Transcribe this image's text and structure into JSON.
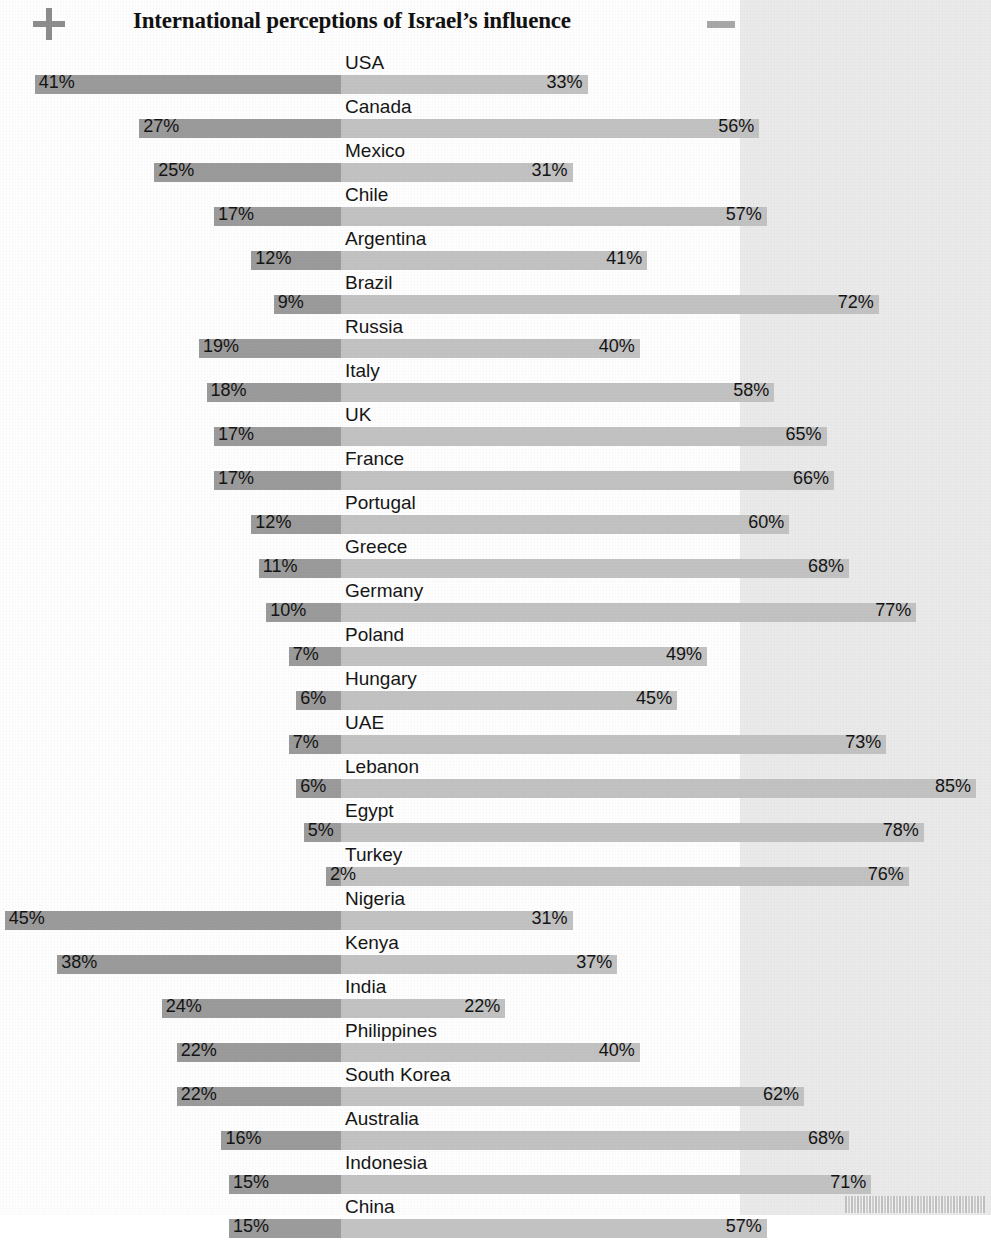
{
  "header": {
    "title": "International perceptions of Israel’s influence",
    "plus_icon": "plus-icon",
    "minus_icon": "minus-icon"
  },
  "footer": {
    "barcode": "barcode-stub"
  },
  "colors": {
    "bar_left": "#9b9b9b",
    "bar_right": "#c2c2c2",
    "tint_band": "#eaeaea",
    "text": "#141414",
    "icon": "#8d8d8d"
  },
  "chart_data": {
    "type": "bar",
    "subtype": "diverging-horizontal",
    "title": "International perceptions of Israel’s influence",
    "xlabel": "",
    "ylabel": "",
    "grid": false,
    "legend_position": "none",
    "axis_center_percent": 0,
    "units": "%",
    "series": [
      {
        "name": "Mainly positive",
        "direction": "left",
        "color": "#9b9b9b"
      },
      {
        "name": "Mainly negative",
        "direction": "right",
        "color": "#c2c2c2"
      }
    ],
    "categories": [
      "USA",
      "Canada",
      "Mexico",
      "Chile",
      "Argentina",
      "Brazil",
      "Russia",
      "Italy",
      "UK",
      "France",
      "Portugal",
      "Greece",
      "Germany",
      "Poland",
      "Hungary",
      "UAE",
      "Lebanon",
      "Egypt",
      "Turkey",
      "Nigeria",
      "Kenya",
      "India",
      "Philippines",
      "South Korea",
      "Australia",
      "Indonesia",
      "China"
    ],
    "left_values": [
      41,
      27,
      25,
      17,
      12,
      9,
      19,
      18,
      17,
      17,
      12,
      11,
      10,
      7,
      6,
      7,
      6,
      5,
      2,
      45,
      38,
      24,
      22,
      22,
      16,
      15,
      15
    ],
    "right_values": [
      33,
      56,
      31,
      57,
      41,
      72,
      40,
      58,
      65,
      66,
      60,
      68,
      77,
      49,
      45,
      73,
      85,
      78,
      76,
      31,
      37,
      22,
      40,
      62,
      68,
      71,
      57
    ],
    "left_labels": [
      "41%",
      "27%",
      "25%",
      "17%",
      "12%",
      "9%",
      "19%",
      "18%",
      "17%",
      "17%",
      "12%",
      "11%",
      "10%",
      "7%",
      "6%",
      "7%",
      "6%",
      "5%",
      "2%",
      "45%",
      "38%",
      "24%",
      "22%",
      "22%",
      "16%",
      "15%",
      "15%"
    ],
    "right_labels": [
      "33%",
      "56%",
      "31%",
      "57%",
      "41%",
      "72%",
      "40%",
      "58%",
      "65%",
      "66%",
      "60%",
      "68%",
      "77%",
      "49%",
      "45%",
      "73%",
      "85%",
      "78%",
      "76%",
      "31%",
      "37%",
      "22%",
      "40%",
      "62%",
      "68%",
      "71%",
      "57%"
    ],
    "xlim": [
      -50,
      90
    ]
  },
  "rows": [
    {
      "country": "USA",
      "left": 41,
      "right": 33,
      "left_label": "41%",
      "right_label": "33%"
    },
    {
      "country": "Canada",
      "left": 27,
      "right": 56,
      "left_label": "27%",
      "right_label": "56%"
    },
    {
      "country": "Mexico",
      "left": 25,
      "right": 31,
      "left_label": "25%",
      "right_label": "31%"
    },
    {
      "country": "Chile",
      "left": 17,
      "right": 57,
      "left_label": "17%",
      "right_label": "57%"
    },
    {
      "country": "Argentina",
      "left": 12,
      "right": 41,
      "left_label": "12%",
      "right_label": "41%"
    },
    {
      "country": "Brazil",
      "left": 9,
      "right": 72,
      "left_label": "9%",
      "right_label": "72%"
    },
    {
      "country": "Russia",
      "left": 19,
      "right": 40,
      "left_label": "19%",
      "right_label": "40%"
    },
    {
      "country": "Italy",
      "left": 18,
      "right": 58,
      "left_label": "18%",
      "right_label": "58%"
    },
    {
      "country": "UK",
      "left": 17,
      "right": 65,
      "left_label": "17%",
      "right_label": "65%"
    },
    {
      "country": "France",
      "left": 17,
      "right": 66,
      "left_label": "17%",
      "right_label": "66%"
    },
    {
      "country": "Portugal",
      "left": 12,
      "right": 60,
      "left_label": "12%",
      "right_label": "60%"
    },
    {
      "country": "Greece",
      "left": 11,
      "right": 68,
      "left_label": "11%",
      "right_label": "68%"
    },
    {
      "country": "Germany",
      "left": 10,
      "right": 77,
      "left_label": "10%",
      "right_label": "77%"
    },
    {
      "country": "Poland",
      "left": 7,
      "right": 49,
      "left_label": "7%",
      "right_label": "49%"
    },
    {
      "country": "Hungary",
      "left": 6,
      "right": 45,
      "left_label": "6%",
      "right_label": "45%"
    },
    {
      "country": "UAE",
      "left": 7,
      "right": 73,
      "left_label": "7%",
      "right_label": "73%"
    },
    {
      "country": "Lebanon",
      "left": 6,
      "right": 85,
      "left_label": "6%",
      "right_label": "85%"
    },
    {
      "country": "Egypt",
      "left": 5,
      "right": 78,
      "left_label": "5%",
      "right_label": "78%"
    },
    {
      "country": "Turkey",
      "left": 2,
      "right": 76,
      "left_label": "2%",
      "right_label": "76%"
    },
    {
      "country": "Nigeria",
      "left": 45,
      "right": 31,
      "left_label": "45%",
      "right_label": "31%"
    },
    {
      "country": "Kenya",
      "left": 38,
      "right": 37,
      "left_label": "38%",
      "right_label": "37%"
    },
    {
      "country": "India",
      "left": 24,
      "right": 22,
      "left_label": "24%",
      "right_label": "22%"
    },
    {
      "country": "Philippines",
      "left": 22,
      "right": 40,
      "left_label": "22%",
      "right_label": "40%"
    },
    {
      "country": "South Korea",
      "left": 22,
      "right": 62,
      "left_label": "22%",
      "right_label": "62%"
    },
    {
      "country": "Australia",
      "left": 16,
      "right": 68,
      "left_label": "16%",
      "right_label": "68%"
    },
    {
      "country": "Indonesia",
      "left": 15,
      "right": 71,
      "left_label": "15%",
      "right_label": "71%"
    },
    {
      "country": "China",
      "left": 15,
      "right": 57,
      "left_label": "15%",
      "right_label": "57%"
    }
  ]
}
